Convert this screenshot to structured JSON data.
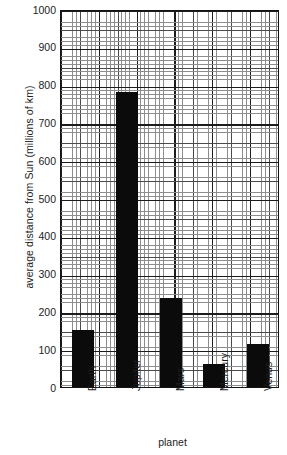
{
  "chart_data": {
    "type": "bar",
    "title": "",
    "xlabel": "planet",
    "ylabel": "average distance from Sun (millions of km)",
    "categories": [
      "Earth",
      "Jupiter",
      "Mars",
      "Mercury",
      "Venus"
    ],
    "values": [
      150,
      780,
      235,
      60,
      115
    ],
    "ylim": [
      0,
      1000
    ],
    "yticks": [
      0,
      100,
      200,
      300,
      400,
      500,
      600,
      700,
      800,
      900,
      1000
    ],
    "ytick_labels": [
      "0",
      "100",
      "200",
      "300",
      "400",
      "500",
      "600",
      "700",
      "800",
      "900",
      "1000"
    ],
    "grid": true,
    "grid_style": "graph-paper minor every 10, medium every 50, major every 100",
    "legend": "none",
    "bar_color": "#0b0b0b",
    "axis_color": "#141414",
    "background": "#ffffff",
    "xtick_rotation": -90
  }
}
